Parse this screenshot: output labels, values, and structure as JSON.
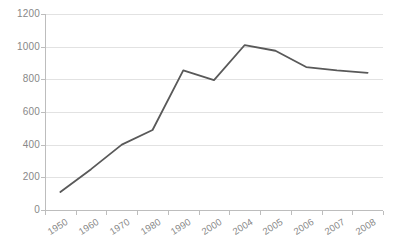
{
  "chart_data": {
    "type": "line",
    "title": "",
    "subtitle": "",
    "xlabel": "",
    "ylabel": "",
    "categories": [
      "1950",
      "1960",
      "1970",
      "1980",
      "1990",
      "2000",
      "2004",
      "2005",
      "2006",
      "2007",
      "2008"
    ],
    "series": [
      {
        "name": "series-1",
        "values": [
          110,
          250,
          400,
          490,
          855,
          795,
          1010,
          975,
          875,
          855,
          840
        ],
        "color": "#595959"
      }
    ],
    "ylim": [
      0,
      1200
    ],
    "ytick_step": 200,
    "yticks": [
      0,
      200,
      400,
      600,
      800,
      1000,
      1200
    ],
    "ytick_labels": [
      "0",
      "200",
      "400",
      "600",
      "800",
      "1000",
      "1200"
    ],
    "grid": {
      "horizontal": true,
      "vertical": false,
      "color": "#e2e2e2"
    },
    "legend": {
      "visible": false,
      "position": "none",
      "entries": []
    },
    "annotations": [],
    "axis": {
      "y_axis_line_color": "#bdbdbd",
      "x_axis_line_color": "#bdbdbd",
      "tick_label_color": "#888888",
      "x_label_rotation_deg": -32
    },
    "background_color": "#ffffff"
  }
}
